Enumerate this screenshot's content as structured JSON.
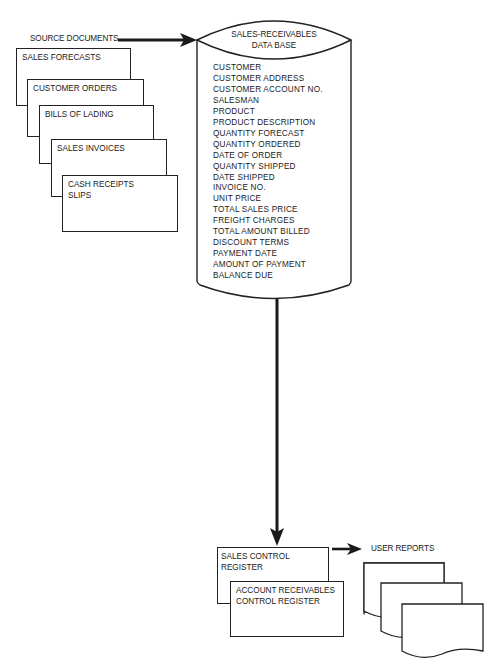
{
  "source_documents": {
    "label": "SOURCE DOCUMENTS",
    "documents": [
      {
        "label": "SALES FORECASTS"
      },
      {
        "label": "CUSTOMER ORDERS"
      },
      {
        "label": "BILLS OF LADING"
      },
      {
        "label": "SALES INVOICES"
      },
      {
        "label": "CASH RECEIPTS\nSLIPS"
      }
    ]
  },
  "database": {
    "title_line1": "SALES-RECEIVABLES",
    "title_line2": "DATA BASE",
    "fields": [
      "CUSTOMER",
      "CUSTOMER ADDRESS",
      "CUSTOMER ACCOUNT NO.",
      "SALESMAN",
      "PRODUCT",
      "PRODUCT DESCRIPTION",
      "QUANTITY FORECAST",
      "QUANTITY ORDERED",
      "DATE OF ORDER",
      "QUANTITY SHIPPED",
      "DATE SHIPPED",
      "INVOICE NO.",
      "UNIT PRICE",
      "TOTAL SALES PRICE",
      "FREIGHT CHARGES",
      "TOTAL AMOUNT BILLED",
      "DISCOUNT TERMS",
      "PAYMENT DATE",
      "AMOUNT OF PAYMENT",
      "BALANCE DUE"
    ]
  },
  "registers": [
    {
      "label": "SALES CONTROL\nREGISTER"
    },
    {
      "label": "ACCOUNT RECEIVABLES\nCONTROL REGISTER"
    }
  ],
  "user_reports": {
    "label": "USER REPORTS",
    "page_count": 3
  },
  "colors": {
    "ink": "#1a1a1a",
    "background": "#ffffff"
  }
}
